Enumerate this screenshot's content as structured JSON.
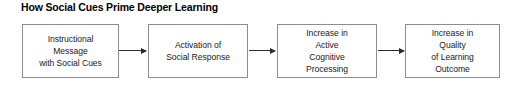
{
  "figure": {
    "title": "How Social Cues Prime Deeper Learning",
    "type": "flowchart",
    "direction": "left-to-right",
    "background_color": "#ffffff",
    "box_border_color": "#8d8d8d",
    "arrow_color": "#2b2b2b",
    "text_color": "#1a1a1a"
  },
  "nodes": [
    {
      "id": "instructional-message",
      "label": "Instructional\nMessage\nwith Social Cues",
      "lines": [
        "Instructional",
        "Message",
        "with Social Cues"
      ],
      "order": 1
    },
    {
      "id": "activation-social-response",
      "label": "Activation of\nSocial Response",
      "lines": [
        "Activation of",
        "Social Response"
      ],
      "order": 2
    },
    {
      "id": "increase-active-cognitive-processing",
      "label": "Increase in\nActive\nCognitive\nProcessing",
      "lines": [
        "Increase in",
        "Active",
        "Cognitive",
        "Processing"
      ],
      "order": 3
    },
    {
      "id": "increase-quality-learning-outcome",
      "label": "Increase in\nQuality\nof Learning\nOutcome",
      "lines": [
        "Increase in",
        "Quality",
        "of Learning",
        "Outcome"
      ],
      "order": 4
    }
  ],
  "connectors": [
    {
      "id": "arrow-1",
      "from": "instructional-message",
      "to": "activation-social-response",
      "glyph": "arrow-right-icon"
    },
    {
      "id": "arrow-2",
      "from": "activation-social-response",
      "to": "increase-active-cognitive-processing",
      "glyph": "arrow-right-icon"
    },
    {
      "id": "arrow-3",
      "from": "increase-active-cognitive-processing",
      "to": "increase-quality-learning-outcome",
      "glyph": "arrow-right-icon"
    }
  ]
}
